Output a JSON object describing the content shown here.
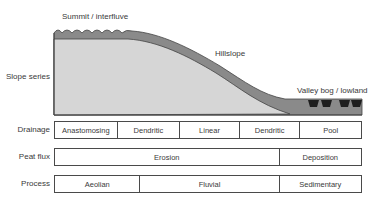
{
  "diagram": {
    "labels": {
      "summit": "Summit / interfluve",
      "hillslope": "Hillslope",
      "valley": "Valley bog / lowland",
      "slope_series": "Slope series"
    },
    "colors": {
      "mineral_fill": "#d6d6d6",
      "peat_fill": "#8a8a8a",
      "outline": "#444444",
      "pool_fill": "#1e1e1e"
    }
  },
  "rows": [
    {
      "label": "Drainage",
      "cells": [
        {
          "text": "Anastomosing",
          "width": 63
        },
        {
          "text": "Dendritic",
          "width": 63
        },
        {
          "text": "Linear",
          "width": 60
        },
        {
          "text": "Dendritic",
          "width": 61
        },
        {
          "text": "Pool",
          "width": 61
        }
      ]
    },
    {
      "label": "Peat flux",
      "cells": [
        {
          "text": "Erosion",
          "width": 226
        },
        {
          "text": "Deposition",
          "width": 82
        }
      ]
    },
    {
      "label": "Process",
      "cells": [
        {
          "text": "Aeolian",
          "width": 86
        },
        {
          "text": "Fluvial",
          "width": 140
        },
        {
          "text": "Sedimentary",
          "width": 82
        }
      ]
    }
  ]
}
